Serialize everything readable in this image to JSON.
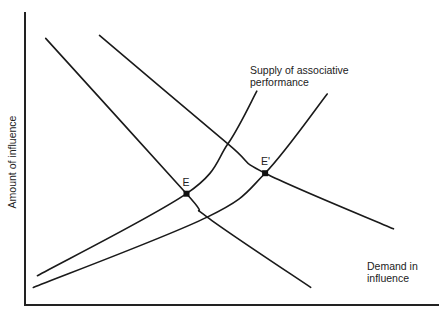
{
  "chart_data": {
    "type": "line",
    "title": "",
    "xlabel": "",
    "ylabel": "Amount of influence",
    "grid": false,
    "curves": [
      {
        "name": "Demand in influence (original)",
        "role": "demand",
        "points": [
          [
            0.05,
            0.91
          ],
          [
            0.39,
            0.38
          ],
          [
            0.44,
            0.3
          ],
          [
            0.69,
            0.06
          ]
        ]
      },
      {
        "name": "Demand in influence (shifted)",
        "role": "demand",
        "points": [
          [
            0.18,
            0.92
          ],
          [
            0.49,
            0.55
          ],
          [
            0.58,
            0.45
          ],
          [
            0.89,
            0.26
          ]
        ]
      },
      {
        "name": "Supply of associative performance (original)",
        "role": "supply",
        "points": [
          [
            0.03,
            0.1
          ],
          [
            0.39,
            0.38
          ],
          [
            0.49,
            0.55
          ],
          [
            0.56,
            0.73
          ]
        ]
      },
      {
        "name": "Supply of associative performance (shifted)",
        "role": "supply",
        "points": [
          [
            0.02,
            0.06
          ],
          [
            0.44,
            0.3
          ],
          [
            0.58,
            0.45
          ],
          [
            0.73,
            0.72
          ]
        ]
      }
    ],
    "points": [
      {
        "label": "E",
        "x": 0.39,
        "y": 0.38
      },
      {
        "label": "E'",
        "x": 0.58,
        "y": 0.45
      }
    ],
    "annotations": [
      {
        "text_lines": [
          "Supply of associative",
          "performance"
        ],
        "near": "supply-curves-top"
      },
      {
        "text_lines": [
          "Demand in",
          "influence"
        ],
        "near": "bottom-right"
      }
    ],
    "xlim": [
      0,
      1
    ],
    "ylim": [
      0,
      1
    ]
  }
}
